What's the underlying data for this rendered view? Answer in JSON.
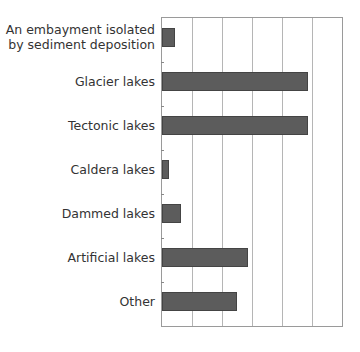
{
  "chart_data": {
    "type": "bar",
    "orientation": "horizontal",
    "title": "",
    "xlabel": "",
    "ylabel": "",
    "categories": [
      "An embayment isolated by sediment deposition",
      "Glacier lakes",
      "Tectonic lakes",
      "Caldera lakes",
      "Dammed lakes",
      "Artificial lakes",
      "Other"
    ],
    "label_lines": [
      [
        "An embayment isolated",
        "by sediment deposition"
      ],
      [
        "Glacier lakes"
      ],
      [
        "Tectonic lakes"
      ],
      [
        "Caldera lakes"
      ],
      [
        "Dammed lakes"
      ],
      [
        "Artificial lakes"
      ],
      [
        "Other"
      ]
    ],
    "values": [
      0.43,
      4.87,
      4.87,
      0.23,
      0.63,
      2.87,
      2.5
    ],
    "xlim": [
      0,
      6
    ],
    "grid": true,
    "gridlines_x": [
      1,
      2,
      3,
      4,
      5
    ],
    "value_units": "grid intervals (axis tick labels not shown)",
    "bar_color": "#5c5c5c"
  }
}
